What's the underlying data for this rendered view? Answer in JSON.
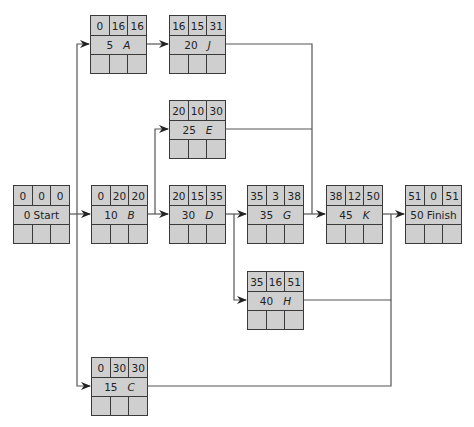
{
  "diagram": {
    "type": "activity-on-node network (critical path)",
    "nodes": [
      {
        "id": "start",
        "duration": "0",
        "name": "Start",
        "es": "0",
        "slack": "0",
        "ef": "0",
        "x": 13,
        "y": 185
      },
      {
        "id": "A",
        "duration": "5",
        "name": "A",
        "es": "0",
        "slack": "16",
        "ef": "16",
        "x": 90,
        "y": 15
      },
      {
        "id": "B",
        "duration": "10",
        "name": "B",
        "es": "0",
        "slack": "20",
        "ef": "20",
        "x": 91,
        "y": 185
      },
      {
        "id": "C",
        "duration": "15",
        "name": "C",
        "es": "0",
        "slack": "30",
        "ef": "30",
        "x": 91,
        "y": 357
      },
      {
        "id": "J",
        "duration": "20",
        "name": "J",
        "es": "16",
        "slack": "15",
        "ef": "31",
        "x": 169,
        "y": 15
      },
      {
        "id": "E",
        "duration": "25",
        "name": "E",
        "es": "20",
        "slack": "10",
        "ef": "30",
        "x": 169,
        "y": 100
      },
      {
        "id": "D",
        "duration": "30",
        "name": "D",
        "es": "20",
        "slack": "15",
        "ef": "35",
        "x": 169,
        "y": 185
      },
      {
        "id": "G",
        "duration": "35",
        "name": "G",
        "es": "35",
        "slack": "3",
        "ef": "38",
        "x": 247,
        "y": 185
      },
      {
        "id": "H",
        "duration": "40",
        "name": "H",
        "es": "35",
        "slack": "16",
        "ef": "51",
        "x": 247,
        "y": 271
      },
      {
        "id": "K",
        "duration": "45",
        "name": "K",
        "es": "38",
        "slack": "12",
        "ef": "50",
        "x": 326,
        "y": 185
      },
      {
        "id": "finish",
        "duration": "50",
        "name": "Finish",
        "es": "51",
        "slack": "0",
        "ef": "51",
        "x": 405,
        "y": 185
      }
    ],
    "edges": [
      [
        "start",
        "A"
      ],
      [
        "start",
        "B"
      ],
      [
        "start",
        "C"
      ],
      [
        "A",
        "J"
      ],
      [
        "B",
        "E"
      ],
      [
        "B",
        "D"
      ],
      [
        "D",
        "G"
      ],
      [
        "D",
        "H"
      ],
      [
        "J",
        "K"
      ],
      [
        "E",
        "K"
      ],
      [
        "G",
        "K"
      ],
      [
        "K",
        "finish"
      ],
      [
        "H",
        "finish"
      ],
      [
        "C",
        "finish"
      ]
    ],
    "colors": {
      "node_fill": "#cfcfcf",
      "border": "#3a3a3a",
      "line": "#555555"
    }
  }
}
